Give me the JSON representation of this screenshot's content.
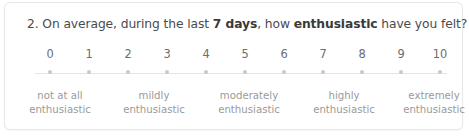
{
  "survey_item": {
    "number": "2.",
    "question_parts": [
      {
        "text": "2. On average, during the last ",
        "bold": false
      },
      {
        "text": "7 days",
        "bold": true
      },
      {
        "text": ", how ",
        "bold": false
      },
      {
        "text": "enthusiastic",
        "bold": true
      },
      {
        "text": " have you felt?",
        "bold": false
      }
    ],
    "question_plain": "2. On average, during the last 7 days, how enthusiastic have you felt?",
    "scale": {
      "type": "numeric-rating-scale",
      "min": 0,
      "max": 10,
      "ticks": [
        "0",
        "1",
        "2",
        "3",
        "4",
        "5",
        "6",
        "7",
        "8",
        "9",
        "10"
      ],
      "selected": null,
      "dot_color": "#c9c9c9",
      "line_color": "#e3e3e3",
      "number_color": "#6d6d6d"
    },
    "anchors": [
      {
        "line1": "not at all",
        "line2": "enthusiastic",
        "x": 55
      },
      {
        "line1": "mildly",
        "line2": "enthusiastic",
        "x": 149
      },
      {
        "line1": "moderately",
        "line2": "enthusiastic",
        "x": 244
      },
      {
        "line1": "highly",
        "line2": "enthusiastic",
        "x": 339
      },
      {
        "line1": "extremely",
        "line2": "enthusiastic",
        "x": 429
      }
    ],
    "anchor_color": "#9a9a9a",
    "card_background": "#ffffff",
    "card_border": "#e8e8e8",
    "text_color": "#4b4b4b"
  }
}
